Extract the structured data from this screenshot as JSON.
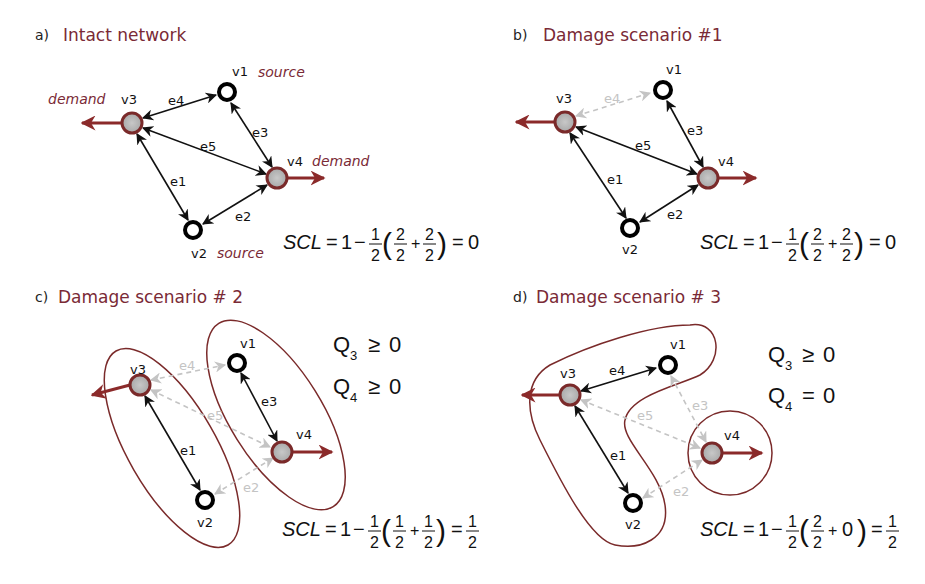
{
  "colors": {
    "accent_maroon": "#7a2a36",
    "demand_arrow": "#8b2a2a",
    "demand_node_fill": "#b8b8b8",
    "source_node_stroke": "#000000",
    "broken_edge": "#c4c4c4",
    "intact_edge": "#111111"
  },
  "panels": [
    {
      "letter": "a)",
      "title": "Intact network",
      "nodes": {
        "v1": "v1",
        "v2": "v2",
        "v3": "v3",
        "v4": "v4"
      },
      "roles": {
        "v1": "source",
        "v2": "source",
        "v3": "demand",
        "v4": "demand"
      },
      "edges": {
        "e1": "e1",
        "e2": "e2",
        "e3": "e3",
        "e4": "e4",
        "e5": "e5"
      },
      "intact_edges": [
        "e1",
        "e2",
        "e3",
        "e4",
        "e5"
      ],
      "broken_edges": [],
      "formula": {
        "lhs": "SCL",
        "one": "1",
        "outer_num": "1",
        "outer_den": "2",
        "t1_num": "2",
        "t1_den": "2",
        "plus": "+",
        "t2_num": "2",
        "t2_den": "2",
        "result": "0"
      }
    },
    {
      "letter": "b)",
      "title": "Damage scenario #1",
      "nodes": {
        "v1": "v1",
        "v2": "v2",
        "v3": "v3",
        "v4": "v4"
      },
      "edges": {
        "e1": "e1",
        "e2": "e2",
        "e3": "e3",
        "e4": "e4",
        "e5": "e5"
      },
      "intact_edges": [
        "e1",
        "e2",
        "e3",
        "e5"
      ],
      "broken_edges": [
        "e4"
      ],
      "formula": {
        "lhs": "SCL",
        "one": "1",
        "outer_num": "1",
        "outer_den": "2",
        "t1_num": "2",
        "t1_den": "2",
        "plus": "+",
        "t2_num": "2",
        "t2_den": "2",
        "result": "0"
      }
    },
    {
      "letter": "c)",
      "title": "Damage scenario # 2",
      "nodes": {
        "v1": "v1",
        "v2": "v2",
        "v3": "v3",
        "v4": "v4"
      },
      "edges": {
        "e1": "e1",
        "e2": "e2",
        "e3": "e3",
        "e4": "e4",
        "e5": "e5"
      },
      "intact_edges": [
        "e1",
        "e3"
      ],
      "broken_edges": [
        "e2",
        "e4",
        "e5"
      ],
      "conditions": [
        {
          "var": "Q",
          "sub": "3",
          "op": "≥",
          "val": "0"
        },
        {
          "var": "Q",
          "sub": "4",
          "op": "≥",
          "val": "0"
        }
      ],
      "formula": {
        "lhs": "SCL",
        "one": "1",
        "outer_num": "1",
        "outer_den": "2",
        "t1_num": "1",
        "t1_den": "2",
        "plus": "+",
        "t2_num": "1",
        "t2_den": "2",
        "result_num": "1",
        "result_den": "2"
      }
    },
    {
      "letter": "d)",
      "title": "Damage scenario # 3",
      "nodes": {
        "v1": "v1",
        "v2": "v2",
        "v3": "v3",
        "v4": "v4"
      },
      "edges": {
        "e1": "e1",
        "e2": "e2",
        "e3": "e3",
        "e4": "e4",
        "e5": "e5"
      },
      "intact_edges": [
        "e1",
        "e4"
      ],
      "broken_edges": [
        "e2",
        "e3",
        "e5"
      ],
      "conditions": [
        {
          "var": "Q",
          "sub": "3",
          "op": "≥",
          "val": "0"
        },
        {
          "var": "Q",
          "sub": "4",
          "op": "=",
          "val": "0"
        }
      ],
      "formula": {
        "lhs": "SCL",
        "one": "1",
        "outer_num": "1",
        "outer_den": "2",
        "t1_num": "2",
        "t1_den": "2",
        "plus": "+",
        "t2": "0",
        "result_num": "1",
        "result_den": "2"
      }
    }
  ]
}
